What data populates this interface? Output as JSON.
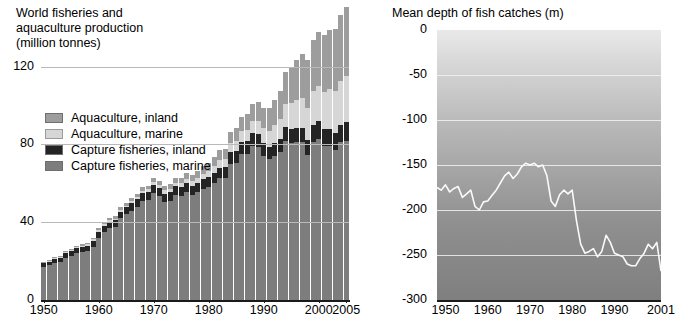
{
  "left": {
    "title_lines": [
      "World fisheries and",
      "aquaculture production",
      "(million tonnes)"
    ],
    "legend": [
      {
        "key": "aquaculture_inland",
        "label": "Aquaculture, inland",
        "color": "#9d9d9d"
      },
      {
        "key": "aquaculture_marine",
        "label": "Aquaculture, marine",
        "color": "#d6d6d6"
      },
      {
        "key": "capture_inland",
        "label": "Capture fisheries, inland",
        "color": "#242424"
      },
      {
        "key": "capture_marine",
        "label": "Capture fisheries, marine",
        "color": "#7d7d7d"
      }
    ]
  },
  "right": {
    "title": "Mean depth of fish catches (m)"
  },
  "chart_data": [
    {
      "type": "bar",
      "id": "world-fisheries-production",
      "title": "World fisheries and aquaculture production (million tonnes)",
      "xlabel": "",
      "ylabel": "million tonnes",
      "ylim": [
        0,
        145
      ],
      "yticks": [
        0,
        40,
        80,
        120
      ],
      "ytick_labels": [
        "0",
        "40",
        "80",
        "120"
      ],
      "grid": true,
      "legend_position": "inside-left",
      "stacked": true,
      "xticks": [
        1950,
        1960,
        1970,
        1980,
        1990,
        2000,
        2005
      ],
      "xtick_labels": [
        "1950",
        "1960",
        "1970",
        "1980",
        "1990",
        "2000",
        "2005"
      ],
      "categories": [
        1950,
        1951,
        1952,
        1953,
        1954,
        1955,
        1956,
        1957,
        1958,
        1959,
        1960,
        1961,
        1962,
        1963,
        1964,
        1965,
        1966,
        1967,
        1968,
        1969,
        1970,
        1971,
        1972,
        1973,
        1974,
        1975,
        1976,
        1977,
        1978,
        1979,
        1980,
        1981,
        1982,
        1983,
        1984,
        1985,
        1986,
        1987,
        1988,
        1989,
        1990,
        1991,
        1992,
        1993,
        1994,
        1995,
        1996,
        1997,
        1998,
        1999,
        2000,
        2001,
        2002,
        2003,
        2004,
        2005
      ],
      "series": [
        {
          "name": "Capture fisheries, marine",
          "color": "#7d7d7d",
          "values": [
            17.0,
            18.0,
            19.0,
            19.5,
            21.5,
            22.5,
            24.0,
            24.5,
            25.0,
            27.5,
            32.0,
            35.0,
            37.0,
            37.5,
            42.0,
            44.0,
            46.0,
            48.0,
            51.0,
            51.5,
            55.0,
            53.5,
            50.5,
            51.0,
            54.0,
            53.5,
            55.5,
            54.0,
            55.5,
            57.0,
            58.0,
            60.0,
            62.5,
            62.5,
            70.0,
            70.5,
            75.0,
            75.0,
            79.0,
            78.5,
            74.0,
            72.5,
            74.0,
            76.0,
            82.0,
            80.5,
            81.0,
            81.0,
            74.5,
            81.5,
            83.0,
            79.0,
            79.0,
            77.0,
            81.0,
            82.0
          ]
        },
        {
          "name": "Capture fisheries, inland",
          "color": "#242424",
          "values": [
            2.0,
            2.0,
            2.2,
            2.3,
            2.5,
            2.6,
            2.7,
            2.8,
            2.9,
            3.0,
            3.1,
            3.2,
            3.3,
            3.4,
            3.5,
            3.6,
            3.7,
            3.8,
            3.9,
            4.0,
            4.0,
            4.0,
            4.2,
            4.3,
            4.4,
            4.5,
            4.6,
            4.7,
            4.8,
            5.0,
            5.2,
            5.4,
            5.6,
            5.8,
            6.0,
            6.2,
            6.4,
            6.6,
            6.8,
            6.9,
            6.5,
            6.3,
            6.5,
            6.7,
            6.9,
            7.2,
            7.4,
            7.5,
            7.8,
            8.5,
            8.8,
            8.7,
            8.8,
            9.0,
            9.2,
            9.6
          ]
        },
        {
          "name": "Aquaculture, marine",
          "color": "#d6d6d6",
          "values": [
            0.3,
            0.3,
            0.4,
            0.4,
            0.5,
            0.5,
            0.6,
            0.6,
            0.7,
            0.7,
            0.8,
            0.8,
            0.9,
            0.9,
            1.0,
            1.0,
            1.1,
            1.2,
            1.3,
            1.4,
            1.5,
            1.6,
            1.7,
            1.8,
            1.9,
            2.0,
            2.2,
            2.4,
            2.6,
            2.9,
            3.2,
            3.5,
            3.8,
            4.1,
            4.5,
            5.0,
            5.4,
            5.8,
            6.3,
            6.8,
            7.7,
            8.3,
            9.3,
            10.5,
            11.8,
            13.5,
            14.5,
            15.5,
            16.5,
            17.5,
            18.5,
            19.5,
            20.5,
            21.5,
            22.5,
            23.5
          ]
        },
        {
          "name": "Aquaculture, inland",
          "color": "#9d9d9d",
          "values": [
            0.3,
            0.3,
            0.4,
            0.4,
            0.5,
            0.5,
            0.6,
            0.7,
            0.7,
            0.8,
            0.9,
            1.0,
            1.1,
            1.2,
            1.3,
            1.4,
            1.5,
            1.6,
            1.7,
            1.8,
            2.0,
            2.1,
            2.2,
            2.4,
            2.6,
            2.8,
            3.0,
            3.2,
            3.5,
            3.8,
            4.2,
            4.6,
            5.0,
            5.5,
            6.0,
            6.6,
            7.2,
            8.0,
            8.8,
            9.6,
            10.5,
            11.5,
            12.8,
            14.5,
            16.5,
            18.5,
            20.5,
            22.5,
            24.5,
            26.0,
            27.5,
            29.0,
            30.5,
            32.0,
            34.0,
            35.5
          ]
        }
      ]
    },
    {
      "type": "line",
      "id": "mean-depth-of-fish-catches",
      "title": "Mean depth of fish catches (m)",
      "xlabel": "",
      "ylabel": "m",
      "ylim": [
        -300,
        0
      ],
      "yticks": [
        0,
        -50,
        -100,
        -150,
        -200,
        -250,
        -300
      ],
      "ytick_labels": [
        "0",
        "-50",
        "-100",
        "-150",
        "-200",
        "-250",
        "-300"
      ],
      "grid": true,
      "line_color": "#fafafa",
      "background": "depth gradient light-to-dark top-to-bottom",
      "xticks": [
        1950,
        1960,
        1970,
        1980,
        1990,
        2001
      ],
      "xtick_labels": [
        "1950",
        "1960",
        "1970",
        "1980",
        "1990",
        "2001"
      ],
      "x": [
        1948,
        1949,
        1950,
        1951,
        1952,
        1953,
        1954,
        1955,
        1956,
        1957,
        1958,
        1959,
        1960,
        1961,
        1962,
        1963,
        1964,
        1965,
        1966,
        1967,
        1968,
        1969,
        1970,
        1971,
        1972,
        1973,
        1974,
        1975,
        1976,
        1977,
        1978,
        1979,
        1980,
        1981,
        1982,
        1983,
        1984,
        1985,
        1986,
        1987,
        1988,
        1989,
        1990,
        1991,
        1992,
        1993,
        1994,
        1995,
        1996,
        1997,
        1998,
        1999,
        2000,
        2001
      ],
      "values": [
        -175,
        -178,
        -172,
        -180,
        -176,
        -174,
        -186,
        -182,
        -178,
        -196,
        -200,
        -191,
        -190,
        -184,
        -178,
        -170,
        -162,
        -158,
        -165,
        -160,
        -152,
        -148,
        -150,
        -148,
        -152,
        -150,
        -162,
        -190,
        -196,
        -183,
        -178,
        -182,
        -178,
        -212,
        -238,
        -248,
        -246,
        -243,
        -252,
        -246,
        -228,
        -236,
        -248,
        -250,
        -252,
        -260,
        -262,
        -262,
        -254,
        -248,
        -238,
        -243,
        -236,
        -268
      ]
    }
  ]
}
